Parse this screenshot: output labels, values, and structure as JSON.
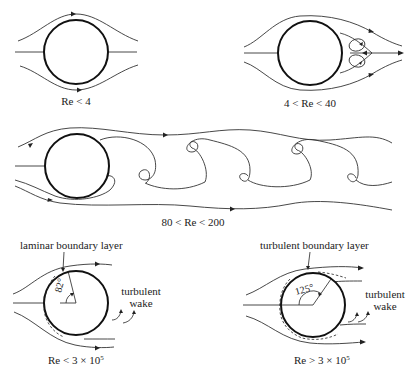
{
  "figure": {
    "panels": [
      {
        "id": "creeping",
        "caption": "Re < 4"
      },
      {
        "id": "attached-eddies",
        "caption": "4 < Re < 40"
      },
      {
        "id": "vortex-street",
        "caption": "80 < Re < 200"
      },
      {
        "id": "laminar-separation",
        "caption_main": "Re < 3 × 10",
        "caption_exp": "5",
        "boundary_layer_label": "laminar boundary layer",
        "separation_angle": "82°",
        "wake_label_line1": "turbulent",
        "wake_label_line2": "wake"
      },
      {
        "id": "turbulent-separation",
        "caption_main": "Re > 3 × 10",
        "caption_exp": "5",
        "boundary_layer_label": "turbulent boundary layer",
        "separation_angle": "125°",
        "wake_label_line1": "turbulent",
        "wake_label_line2": "wake"
      }
    ]
  }
}
